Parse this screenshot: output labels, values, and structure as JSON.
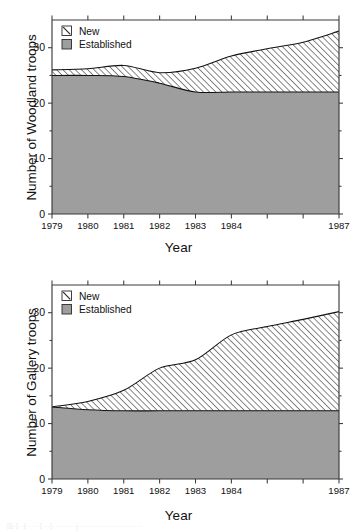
{
  "figures": [
    {
      "id": "woodland",
      "legend": {
        "new_label": "New",
        "established_label": "Established"
      },
      "ylabel": "Number of Woodland troops",
      "xlabel": "Year"
    },
    {
      "id": "gallery",
      "legend": {
        "new_label": "New",
        "established_label": "Established"
      },
      "ylabel": "Number of Gallery troops",
      "xlabel": "Year"
    }
  ],
  "colors": {
    "established_fill": "#9e9e9e",
    "hatch_stroke": "#3f3f3f",
    "axis": "#3a3a3a",
    "text": "#111111",
    "background": "#ffffff"
  },
  "bleed": {
    "text": "·lli·l··f·····l···l·········j························"
  },
  "chart_data": [
    {
      "type": "area",
      "title": "",
      "subtitle": "",
      "xlabel": "Year",
      "ylabel": "Number of Woodland troops",
      "xlim": [
        1979,
        1987
      ],
      "ylim": [
        0,
        35
      ],
      "yticks": [
        0,
        10,
        20,
        30
      ],
      "ytick_labels": [
        "0",
        "10",
        "20",
        "30"
      ],
      "xticks": [
        1979,
        1980,
        1981,
        1982,
        1983,
        1984,
        1985,
        1986,
        1987
      ],
      "xtick_labels": [
        "1979",
        "1980",
        "1981",
        "1982",
        "1983",
        "1984",
        "",
        "",
        "1987"
      ],
      "grid": false,
      "stacked": true,
      "legend_position": "top-left",
      "legend": [
        "New",
        "Established"
      ],
      "x": [
        1979,
        1980,
        1981,
        1982,
        1983,
        1984,
        1985,
        1986,
        1987
      ],
      "series": [
        {
          "name": "Established",
          "fill": "solid-gray",
          "values": [
            25.0,
            25.0,
            24.8,
            23.6,
            22.0,
            22.0,
            22.0,
            22.0,
            22.0
          ]
        },
        {
          "name": "New",
          "fill": "diagonal-hatch",
          "values": [
            1.0,
            1.2,
            2.0,
            1.9,
            4.3,
            6.5,
            7.8,
            9.0,
            11.0
          ]
        }
      ],
      "totals": [
        26.0,
        26.2,
        26.8,
        25.5,
        26.3,
        28.5,
        29.8,
        31.0,
        33.0
      ]
    },
    {
      "type": "area",
      "title": "",
      "subtitle": "",
      "xlabel": "Year",
      "ylabel": "Number of Gallery troops",
      "xlim": [
        1979,
        1987
      ],
      "ylim": [
        0,
        35
      ],
      "yticks": [
        0,
        10,
        20,
        30
      ],
      "ytick_labels": [
        "0",
        "10",
        "20",
        "30"
      ],
      "xticks": [
        1979,
        1980,
        1981,
        1982,
        1983,
        1984,
        1985,
        1986,
        1987
      ],
      "xtick_labels": [
        "1979",
        "1980",
        "1981",
        "1982",
        "1983",
        "1984",
        "",
        "",
        "1987"
      ],
      "grid": false,
      "stacked": true,
      "legend_position": "top-left",
      "legend": [
        "New",
        "Established"
      ],
      "x": [
        1979,
        1980,
        1981,
        1982,
        1983,
        1984,
        1985,
        1986,
        1987
      ],
      "series": [
        {
          "name": "Established",
          "fill": "solid-gray",
          "values": [
            13.0,
            12.5,
            12.3,
            12.3,
            12.3,
            12.3,
            12.3,
            12.3,
            12.3
          ]
        },
        {
          "name": "New",
          "fill": "diagonal-hatch",
          "values": [
            0.0,
            1.5,
            3.7,
            7.7,
            9.2,
            13.7,
            15.2,
            16.5,
            17.9
          ]
        }
      ],
      "totals": [
        13.0,
        14.0,
        16.0,
        20.0,
        21.5,
        26.0,
        27.5,
        28.8,
        30.2
      ]
    }
  ]
}
